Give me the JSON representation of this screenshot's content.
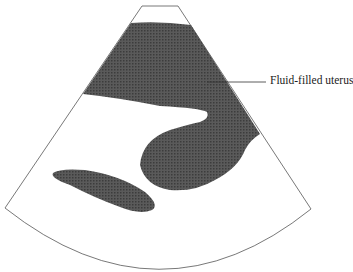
{
  "diagram": {
    "type": "ultrasound schematic",
    "labels": [
      {
        "text": "Fluid-filled uterus",
        "target": "dark-fluid-region"
      }
    ],
    "colors": {
      "fluid_fill": "#4a4a4a",
      "outline": "#555555",
      "background": "#ffffff"
    }
  }
}
